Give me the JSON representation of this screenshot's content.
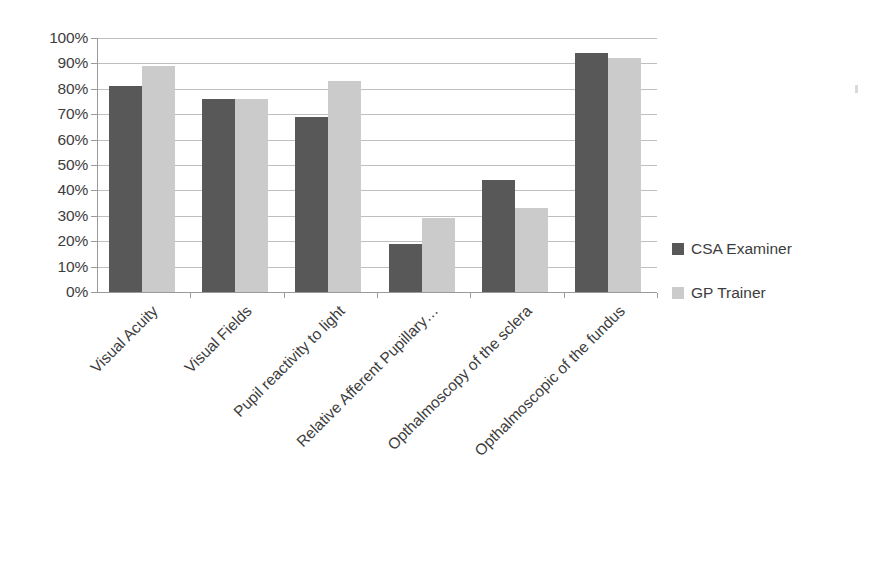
{
  "chart_data": {
    "type": "bar",
    "title": "",
    "subtitle": "",
    "xlabel": "",
    "ylabel": "",
    "ylim": [
      0,
      100
    ],
    "ytick_labels": [
      "100%",
      "90%",
      "80%",
      "70%",
      "60%",
      "50%",
      "40%",
      "30%",
      "20%",
      "10%",
      "0%"
    ],
    "ytick_values": [
      100,
      90,
      80,
      70,
      60,
      50,
      40,
      30,
      20,
      10,
      0
    ],
    "grid": true,
    "legend_position": "right",
    "value_unit": "%",
    "categories": [
      "Visual Acuity",
      "Visual Fields",
      "Pupil reactivity to light",
      "Relative Afferent Pupillary…",
      "Opthalmoscopy of the sclera",
      "Opthalmoscopic of the fundus"
    ],
    "series": [
      {
        "name": "CSA Examiner",
        "color": "#585858",
        "values": [
          81,
          76,
          69,
          19,
          44,
          94
        ]
      },
      {
        "name": "GP Trainer",
        "color": "#cbcbcb",
        "values": [
          89,
          76,
          83,
          29,
          33,
          92
        ]
      }
    ]
  },
  "legend": {
    "items": [
      {
        "label": "CSA Examiner",
        "swatch": "series0"
      },
      {
        "label": "GP Trainer",
        "swatch": "series1"
      }
    ]
  }
}
